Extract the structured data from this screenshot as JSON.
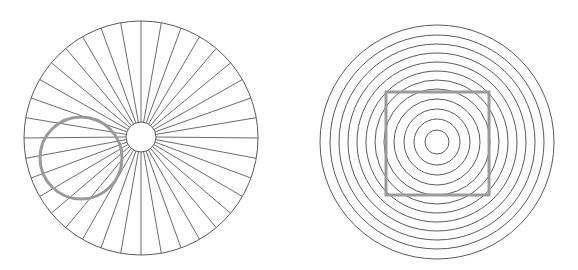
{
  "figures": [
    {
      "id": "radial-spokes",
      "description": "Circle with radiating spokes and a distorted-looking overlaid circle",
      "outer_circle": {
        "cx": 141,
        "cy": 138,
        "r": 117
      },
      "hub_circle": {
        "cx": 141,
        "cy": 137,
        "r": 15
      },
      "spoke_count": 36,
      "overlay_circle": {
        "cx": 81,
        "cy": 158,
        "r": 41,
        "stroke_width": 3
      }
    },
    {
      "id": "concentric-rings",
      "description": "Concentric circles with a distorted-looking overlaid square",
      "center": {
        "cx": 437,
        "cy": 142
      },
      "ring_radii": [
        12,
        23,
        33,
        43,
        53,
        62,
        71,
        80,
        89,
        98,
        107,
        117
      ],
      "overlay_square": {
        "x": 386,
        "y": 92,
        "size": 103,
        "stroke_width": 3
      }
    }
  ],
  "colors": {
    "background": "#ffffff",
    "line": "#5a5a5a",
    "overlay": "#9a9a9a"
  }
}
